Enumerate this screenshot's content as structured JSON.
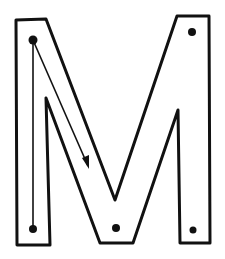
{
  "figure": {
    "letter": "M",
    "colors": {
      "background": "#ffffff",
      "ink": "#111111"
    },
    "outline_points": "16,20 46,19 115,200 177,16 209,16 210,243 180,243 178,110 133,243 100,243 46,98 50,245 17,245",
    "dots": [
      {
        "name": "start-dot-top-left",
        "cx": 33,
        "cy": 40,
        "r": 4.5
      },
      {
        "name": "dot-top-right",
        "cx": 192,
        "cy": 32,
        "r": 4
      },
      {
        "name": "end-dot-bottom-left",
        "cx": 33,
        "cy": 229,
        "r": 4
      },
      {
        "name": "dot-bottom-middle",
        "cx": 116,
        "cy": 228,
        "r": 4
      },
      {
        "name": "dot-bottom-right",
        "cx": 193,
        "cy": 230,
        "r": 3.5
      }
    ],
    "guide_lines": [
      {
        "name": "vertical-stroke-guide",
        "x1": 33,
        "y1": 40,
        "x2": 33,
        "y2": 229
      },
      {
        "name": "diagonal-stroke-guide",
        "x1": 33,
        "y1": 40,
        "x2": 88,
        "y2": 166
      }
    ],
    "arrowhead_points": "82,158 89,169 89,155"
  }
}
